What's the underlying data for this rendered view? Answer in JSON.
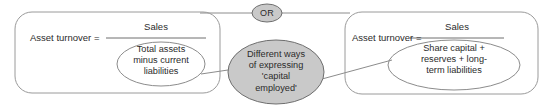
{
  "diagram": {
    "connector_label": "OR",
    "center_node": {
      "lines": [
        "Different ways",
        "of expressing",
        "'capital",
        "employed'"
      ],
      "text": "Different ways of expressing 'capital employed'",
      "fill": "#c9c9c9",
      "stroke": "#6e6e6e"
    },
    "left_box": {
      "label": "Asset turnover =",
      "numerator": "Sales",
      "denominator_lines": [
        "Total assets",
        "minus current",
        "liabilities"
      ],
      "denominator": "Total assets minus current liabilities",
      "stroke": "#9a9a9a"
    },
    "right_box": {
      "label": "Asset turnover =",
      "numerator": "Sales",
      "denominator_lines": [
        "Share capital +",
        "reserves + long-",
        "term liabilities"
      ],
      "denominator": "Share capital + reserves + long-term liabilities",
      "stroke": "#9a9a9a"
    },
    "colors": {
      "line": "#8c8c8c",
      "text": "#2b2b2b",
      "background": "#ffffff"
    }
  }
}
